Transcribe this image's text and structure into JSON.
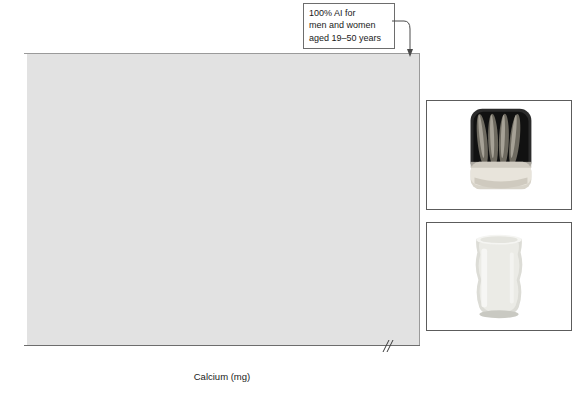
{
  "chart_data": {
    "type": "bar",
    "orientation": "horizontal",
    "title": "",
    "xlabel": "Calcium (mg)",
    "ylabel": "Food and serving size",
    "xlim": [
      0,
      1000
    ],
    "xticks": [
      0,
      50,
      100,
      150,
      200,
      250,
      300,
      350,
      400,
      450,
      1000
    ],
    "xtick_labels": [
      "0",
      "50",
      "100",
      "150",
      "200",
      "250",
      "300",
      "350",
      "400",
      "450",
      "1000"
    ],
    "axis_break": true,
    "axis_break_after": 450,
    "grid": false,
    "legend": null,
    "categories": [
      "Yogurt, plain, skim milk—8 oz container",
      "Collard greens, chopped, frozen, cooked—1 cup",
      "Yogurt, fruit flavored, low-fat—8 oz container",
      "Cheese, ricotta, part skim—1/2 cup",
      "Sardines, canned with bones—3 oz",
      "Milk, skim—1 cup",
      "Milk, 2% fat—1 cup",
      "Cheese, Swiss—1 oz",
      "Kale, frozen, cooked—1 cup",
      "Chinese cabbage, cooked—1 cup",
      "Tofu, soft, prepared with calcium sulfate—4 oz"
    ],
    "values": [
      460,
      357,
      349,
      343,
      336,
      300,
      287,
      223,
      177,
      153,
      133
    ],
    "label_inside": [
      true,
      true,
      true,
      true,
      true,
      true,
      true,
      true,
      false,
      false,
      false
    ],
    "bar_colors": [
      "#565656",
      "#737373",
      "#565656",
      "#737373",
      "#565656",
      "#737373",
      "#565656",
      "#737373",
      "#565656",
      "#737373",
      "#565656"
    ],
    "annotations": [
      {
        "name": "ai-reference",
        "text": "100% AI for\nmen and women\naged 19–50 years",
        "lines": [
          "100% AI for",
          "men and women",
          "aged 19–50 years"
        ],
        "points_to_value": 1000
      }
    ],
    "plot_background": "#e2e2e2",
    "reference_line_color": "#ffffff"
  },
  "photos": [
    {
      "name": "sardines-photo",
      "caption": "",
      "subject": "open can of sardines"
    },
    {
      "name": "milk-photo",
      "caption": "",
      "subject": "glass of milk"
    }
  ]
}
